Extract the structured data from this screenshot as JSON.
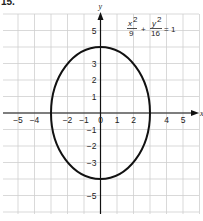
{
  "problem_number": "15.",
  "chart_data": {
    "type": "line",
    "title": "",
    "equation": "x^2/9 + y^2/16 = 1",
    "equation_parts": {
      "x_num": "x",
      "x_den": "9",
      "y_num": "y",
      "y_den": "16",
      "plus": "+",
      "rhs": "= 1",
      "exp": "2"
    },
    "xlabel": "x",
    "ylabel": "y",
    "xlim": [
      -6,
      6
    ],
    "ylim": [
      -6,
      6
    ],
    "grid": true,
    "x_tick_labels": [
      "-5",
      "-4",
      "-2",
      "-1",
      "0",
      "1",
      "2",
      "4",
      "5"
    ],
    "x_ticks": [
      -5,
      -4,
      -2,
      -1,
      0,
      1,
      2,
      4,
      5
    ],
    "y_tick_labels": [
      "5",
      "3",
      "2",
      "1",
      "-1",
      "-2",
      "-3",
      "-5"
    ],
    "y_ticks": [
      5,
      3,
      2,
      1,
      -1,
      -2,
      -3,
      -5
    ],
    "series": [
      {
        "name": "ellipse",
        "center": [
          0,
          0
        ],
        "semi_axis_x": 3,
        "semi_axis_y": 4,
        "vertices": [
          [
            0,
            4
          ],
          [
            0,
            -4
          ]
        ],
        "co_vertices": [
          [
            3,
            0
          ],
          [
            -3,
            0
          ]
        ]
      }
    ]
  }
}
